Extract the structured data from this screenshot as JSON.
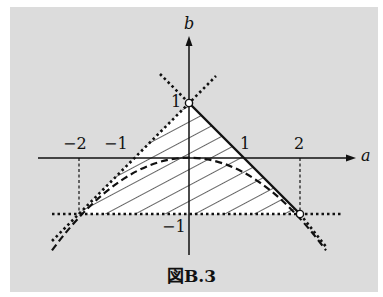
{
  "figure": {
    "caption": "図B.3",
    "axes": {
      "x_label": "a",
      "y_label": "b",
      "x_ticks": [
        "−2",
        "−1",
        "1",
        "2"
      ],
      "y_ticks": [
        "1",
        "−1"
      ]
    },
    "colors": {
      "background": "#dcdcdc",
      "region_fill": "#ffffff",
      "ink": "#111111"
    },
    "curves": [
      {
        "name": "b = 1 - a",
        "style": "solid (segment), dotted extension"
      },
      {
        "name": "b = 1 + a",
        "style": "dotted"
      },
      {
        "name": "b = -a^2/4",
        "style": "dashed"
      },
      {
        "name": "b = -1",
        "style": "dotted"
      }
    ],
    "points": [
      {
        "a": 0,
        "b": 1,
        "marker": "open circle"
      },
      {
        "a": 2,
        "b": -1,
        "marker": "open circle"
      }
    ],
    "region": "hatched triangle with vertices (-2,-1), (0,1), (2,-1)"
  }
}
